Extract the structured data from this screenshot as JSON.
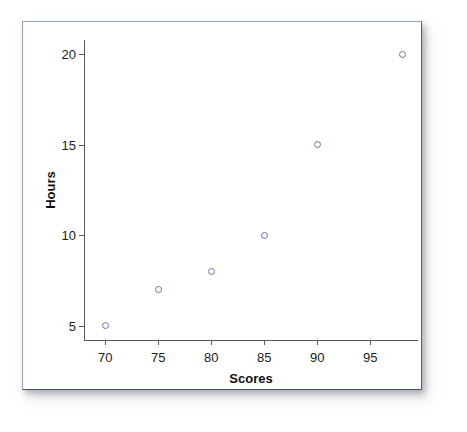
{
  "chart_data": {
    "type": "scatter",
    "title": "",
    "xlabel": "Scores",
    "ylabel": "Hours",
    "xlim": [
      68,
      99.5
    ],
    "ylim": [
      4.2,
      20.8
    ],
    "grid": false,
    "legend": null,
    "marker": "open-circle",
    "marker_color": "#6f6fae",
    "xticks": [
      70,
      75,
      80,
      85,
      90,
      95
    ],
    "xtick_labels": [
      "70",
      "75",
      "80",
      "85",
      "90",
      "95"
    ],
    "yticks": [
      5,
      10,
      15,
      20
    ],
    "ytick_labels": [
      "5",
      "10",
      "15",
      "20"
    ],
    "x": [
      70,
      75,
      80,
      85,
      90,
      98
    ],
    "y": [
      5,
      7,
      8,
      10,
      15,
      20
    ],
    "points": [
      {
        "x": 70,
        "y": 5
      },
      {
        "x": 75,
        "y": 7
      },
      {
        "x": 80,
        "y": 8
      },
      {
        "x": 85,
        "y": 10
      },
      {
        "x": 90,
        "y": 15
      },
      {
        "x": 98,
        "y": 20
      }
    ]
  },
  "figure": {
    "frame_color": "#9aa3c4",
    "background": "#ffffff",
    "axis_color": "#585858"
  }
}
